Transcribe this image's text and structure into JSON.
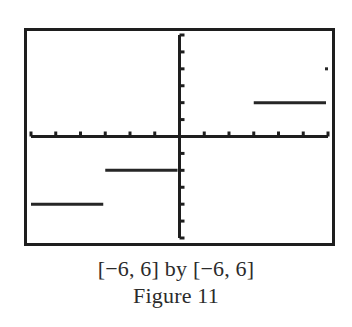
{
  "chart_data": {
    "type": "line",
    "style": "step-function graphing-calculator screen",
    "title": "Figure 11",
    "window_label": "[−6, 6] by [−6, 6]",
    "xlabel": "",
    "ylabel": "",
    "xlim": [
      -6,
      6
    ],
    "ylim": [
      -6,
      6
    ],
    "x_tick_step": 1,
    "y_tick_step": 1,
    "grid": false,
    "legend": null,
    "segments": [
      {
        "x": [
          -6,
          -3
        ],
        "y": [
          -4,
          -4
        ]
      },
      {
        "x": [
          -3,
          0
        ],
        "y": [
          -2,
          -2
        ]
      },
      {
        "x": [
          3,
          6
        ],
        "y": [
          2,
          2
        ]
      }
    ],
    "points": [
      {
        "x": 6,
        "y": 4
      }
    ]
  },
  "caption": {
    "range": "[−6, 6] by [−6, 6]",
    "title": "Figure 11"
  },
  "colors": {
    "frame": "#1e1e1e",
    "axis": "#1e1e1e",
    "plot": "#262626",
    "background": "#ffffff"
  }
}
